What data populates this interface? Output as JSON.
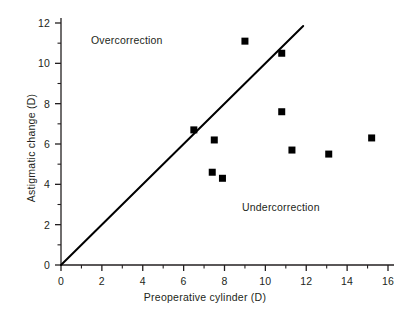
{
  "chart_data": {
    "type": "scatter",
    "title": "",
    "xlabel": "Preoperative cylinder (D)",
    "ylabel": "Astigmatic change (D)",
    "xlim": [
      0,
      16
    ],
    "ylim": [
      0,
      12
    ],
    "x_ticks": [
      0,
      2,
      4,
      6,
      8,
      10,
      12,
      14,
      16
    ],
    "x_tick_labels": [
      "0",
      "2",
      "4",
      "6",
      "8",
      "10",
      "12",
      "14",
      "16"
    ],
    "x_minor_ticks": [
      1,
      3,
      5,
      7,
      9,
      11,
      13,
      15
    ],
    "y_ticks": [
      0,
      2,
      4,
      6,
      8,
      10,
      12
    ],
    "y_tick_labels": [
      "0",
      "2",
      "4",
      "6",
      "8",
      "10",
      "12"
    ],
    "y_minor_ticks": [
      1,
      3,
      5,
      7,
      9,
      11
    ],
    "grid": false,
    "legend": null,
    "marker": "square",
    "marker_color": "#000000",
    "marker_size": 7,
    "points": [
      {
        "x": 6.5,
        "y": 6.7
      },
      {
        "x": 7.5,
        "y": 6.2
      },
      {
        "x": 7.4,
        "y": 4.6
      },
      {
        "x": 7.9,
        "y": 4.3
      },
      {
        "x": 9.0,
        "y": 11.1
      },
      {
        "x": 10.8,
        "y": 10.5
      },
      {
        "x": 10.8,
        "y": 7.6
      },
      {
        "x": 11.3,
        "y": 5.7
      },
      {
        "x": 13.1,
        "y": 5.5
      },
      {
        "x": 15.2,
        "y": 6.3
      }
    ],
    "reference_line": {
      "name": "identity-line",
      "x_start": 0,
      "y_start": 0,
      "x_end": 11.85,
      "y_end": 11.85,
      "color": "#000000",
      "width": 2
    },
    "annotations": [
      {
        "name": "overcorrection",
        "text": "Overcorrection",
        "x": 1.5,
        "y": 11.1
      },
      {
        "name": "undercorrection",
        "text": "Undercorrection",
        "x": 8.9,
        "y": 2.9
      }
    ]
  },
  "axes": {
    "line_color": "#231f20",
    "x_title": "Preoperative cylinder (D)",
    "y_title": "Astigmatic change (D)"
  }
}
